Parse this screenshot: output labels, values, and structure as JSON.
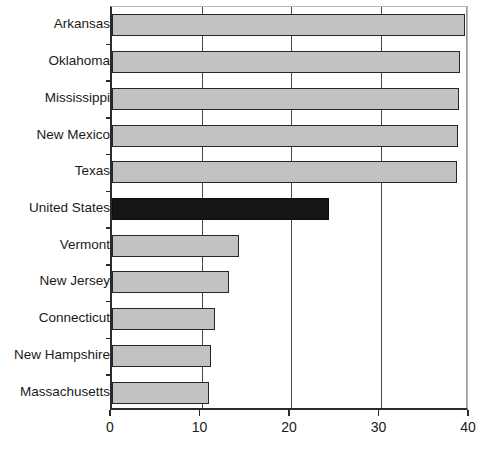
{
  "chart_data": {
    "type": "bar",
    "orientation": "horizontal",
    "title": "",
    "subtitle": "",
    "xlabel": "",
    "ylabel": "",
    "xlim": [
      0,
      40
    ],
    "xticks": [
      0,
      10,
      20,
      30,
      40
    ],
    "xtick_labels": [
      "0",
      "10",
      "20",
      "30",
      "40"
    ],
    "grid": "vertical",
    "legend": "none",
    "categories": [
      "Arkansas",
      "Oklahoma",
      "Mississippi",
      "New Mexico",
      "Texas",
      "United States",
      "Vermont",
      "New Jersey",
      "Connecticut",
      "New Hampshire",
      "Massachusetts"
    ],
    "values": [
      39.4,
      38.9,
      38.8,
      38.7,
      38.6,
      24.2,
      14.2,
      13.1,
      11.5,
      11.1,
      10.8
    ],
    "highlight_index": 5,
    "colors": {
      "bar": "#c2c2c2",
      "bar_border": "#262626",
      "highlight_bar": "#151515",
      "highlight_bar_border": "#0c0c0c",
      "axis": "#2b2b2b",
      "gridline": "#4a4a4a",
      "background": "#ffffff",
      "text": "#1a1a1a"
    }
  }
}
